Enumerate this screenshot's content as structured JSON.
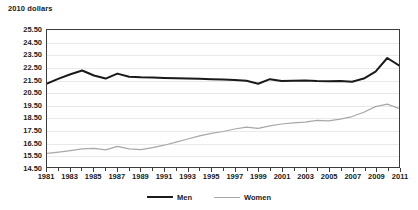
{
  "chart_data": {
    "type": "line",
    "title": "2010 dollars",
    "xlabel": "",
    "ylabel": "2010 dollars",
    "ylim": [
      14.5,
      25.5
    ],
    "ystep": 1.0,
    "grid": true,
    "legend_position": "bottom",
    "x": [
      1981,
      1982,
      1983,
      1984,
      1985,
      1986,
      1987,
      1988,
      1989,
      1990,
      1991,
      1992,
      1993,
      1994,
      1995,
      1996,
      1997,
      1998,
      1999,
      2000,
      2001,
      2002,
      2003,
      2004,
      2005,
      2006,
      2007,
      2008,
      2009,
      2010,
      2011
    ],
    "x_tick_labels": [
      "1981",
      "1983",
      "1985",
      "1987",
      "1989",
      "1991",
      "1993",
      "1995",
      "1997",
      "1999",
      "2001",
      "2003",
      "2005",
      "2007",
      "2009",
      "2011"
    ],
    "y_tick_labels": [
      "25.50",
      "24.50",
      "23.50",
      "22.50",
      "21.50",
      "20.50",
      "19.50",
      "18.50",
      "17.50",
      "16.50",
      "15.50",
      "14.50"
    ],
    "series": [
      {
        "name": "Men",
        "color": "#1a1a1a",
        "width": 2.0,
        "values": [
          21.2,
          21.6,
          21.95,
          22.25,
          21.85,
          21.6,
          22.0,
          21.75,
          21.7,
          21.68,
          21.65,
          21.62,
          21.6,
          21.58,
          21.55,
          21.52,
          21.48,
          21.42,
          21.18,
          21.55,
          21.4,
          21.42,
          21.45,
          21.4,
          21.38,
          21.4,
          21.35,
          21.6,
          22.15,
          23.25,
          22.65
        ]
      },
      {
        "name": "Women",
        "color": "#a8a8a8",
        "width": 1.2,
        "values": [
          15.6,
          15.7,
          15.82,
          15.95,
          16.0,
          15.88,
          16.15,
          15.95,
          15.9,
          16.05,
          16.25,
          16.5,
          16.75,
          17.0,
          17.2,
          17.35,
          17.55,
          17.7,
          17.6,
          17.8,
          17.95,
          18.05,
          18.1,
          18.25,
          18.2,
          18.35,
          18.55,
          18.9,
          19.35,
          19.55,
          19.2
        ]
      }
    ]
  },
  "legend": {
    "men_label": "Men",
    "women_label": "Women"
  }
}
